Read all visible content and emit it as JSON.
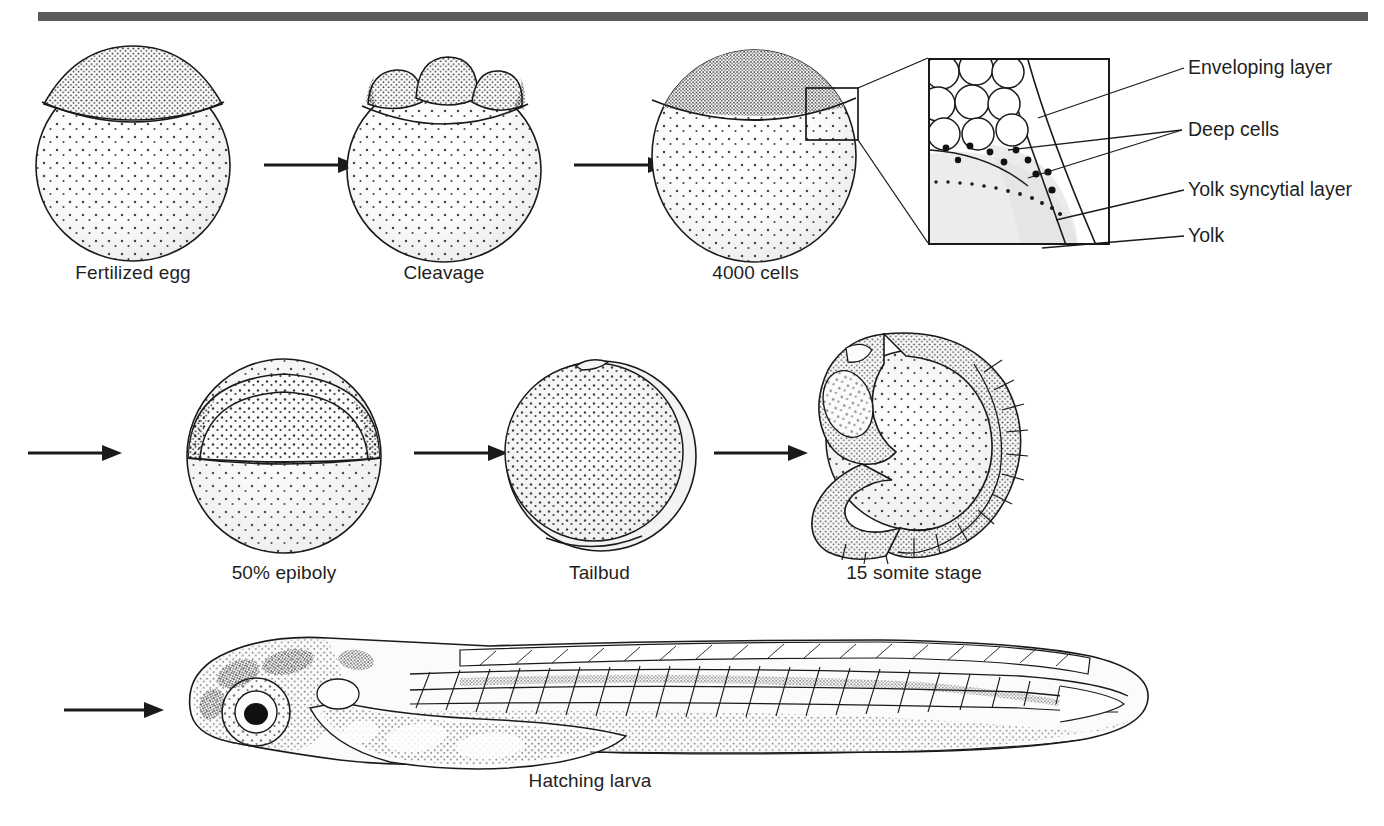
{
  "figure": {
    "type": "scientific-illustration",
    "divider": {
      "color": "#5b5b5b"
    }
  },
  "stages": [
    {
      "id": "fertilized-egg",
      "label": "Fertilized egg",
      "row": 1,
      "order": 1
    },
    {
      "id": "cleavage",
      "label": "Cleavage",
      "row": 1,
      "order": 2
    },
    {
      "id": "4000-cells",
      "label": "4000 cells",
      "row": 1,
      "order": 3
    },
    {
      "id": "50-epiboly",
      "label": "50% epiboly",
      "row": 2,
      "order": 4
    },
    {
      "id": "tailbud",
      "label": "Tailbud",
      "row": 2,
      "order": 5
    },
    {
      "id": "15-somite",
      "label": "15 somite stage",
      "row": 2,
      "order": 6
    },
    {
      "id": "hatching-larva",
      "label": "Hatching larva",
      "row": 3,
      "order": 7
    }
  ],
  "inset": {
    "source_stage": "4000 cells",
    "labels": [
      {
        "id": "enveloping-layer",
        "text": "Enveloping layer"
      },
      {
        "id": "deep-cells",
        "text": "Deep cells"
      },
      {
        "id": "yolk-syncytial-layer",
        "text": "Yolk syncytial layer"
      },
      {
        "id": "yolk",
        "text": "Yolk"
      }
    ]
  },
  "arrows": [
    {
      "id": "arrow-1",
      "from": "fertilized-egg",
      "to": "cleavage"
    },
    {
      "id": "arrow-2",
      "from": "cleavage",
      "to": "4000-cells"
    },
    {
      "id": "arrow-3",
      "from": "4000-cells",
      "to": "50-epiboly"
    },
    {
      "id": "arrow-4",
      "from": "50-epiboly",
      "to": "tailbud"
    },
    {
      "id": "arrow-5",
      "from": "tailbud",
      "to": "15-somite"
    },
    {
      "id": "arrow-6",
      "from": "15-somite",
      "to": "hatching-larva"
    }
  ]
}
